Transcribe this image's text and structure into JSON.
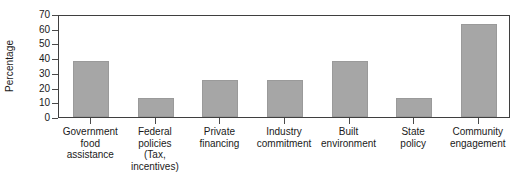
{
  "chart_data": {
    "type": "bar",
    "title": "",
    "xlabel": "",
    "ylabel": "Percentage",
    "ylim": [
      0,
      70
    ],
    "yticks": [
      0,
      10,
      20,
      30,
      40,
      50,
      60,
      70
    ],
    "grid": false,
    "legend": null,
    "bar_color": "#a6a6a6",
    "frame_color": "#3f3f3f",
    "categories": [
      "Government\nfood\nassistance",
      "Federal\npolicies\n(Tax,\nincentives)",
      "Private\nfinancing",
      "Industry\ncommitment",
      "Built\nenvironment",
      "State\npolicy",
      "Community\nengagement"
    ],
    "category_lines": [
      [
        "Government",
        "food",
        "assistance"
      ],
      [
        "Federal",
        "policies",
        "(Tax,",
        "incentives)"
      ],
      [
        "Private",
        "financing"
      ],
      [
        "Industry",
        "commitment"
      ],
      [
        "Built",
        "environment"
      ],
      [
        "State",
        "policy"
      ],
      [
        "Community",
        "engagement"
      ]
    ],
    "values": [
      38,
      13,
      25,
      25,
      38,
      13,
      63
    ]
  }
}
